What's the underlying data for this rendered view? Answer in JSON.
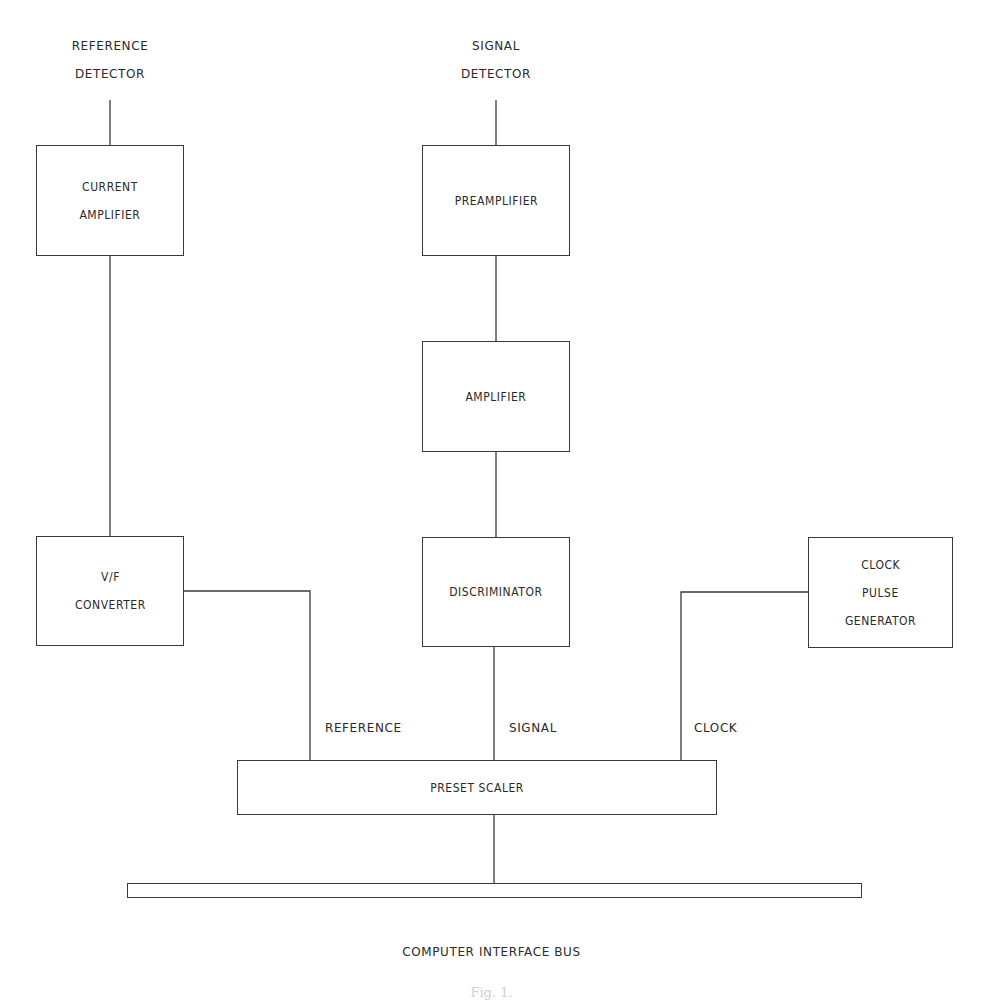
{
  "diagram": {
    "type": "block-diagram",
    "inputs": {
      "reference_detector": [
        "REFERENCE",
        "DETECTOR"
      ],
      "signal_detector": [
        "SIGNAL",
        "DETECTOR"
      ]
    },
    "blocks": {
      "current_amplifier": [
        "CURRENT",
        "AMPLIFIER"
      ],
      "vf_converter": [
        "V/F",
        "CONVERTER"
      ],
      "preamplifier": [
        "PREAMPLIFIER"
      ],
      "amplifier": [
        "AMPLIFIER"
      ],
      "discriminator": [
        "DISCRIMINATOR"
      ],
      "clock_pulse_generator": [
        "CLOCK",
        "PULSE",
        "GENERATOR"
      ],
      "preset_scaler": [
        "PRESET SCALER"
      ]
    },
    "line_labels": {
      "reference": "REFERENCE",
      "signal": "SIGNAL",
      "clock": "CLOCK"
    },
    "bus": {
      "label": "COMPUTER INTERFACE BUS"
    },
    "connections": [
      {
        "from": "REFERENCE DETECTOR",
        "to": "CURRENT AMPLIFIER"
      },
      {
        "from": "CURRENT AMPLIFIER",
        "to": "V/F CONVERTER"
      },
      {
        "from": "V/F CONVERTER",
        "to": "PRESET SCALER",
        "label": "REFERENCE"
      },
      {
        "from": "SIGNAL DETECTOR",
        "to": "PREAMPLIFIER"
      },
      {
        "from": "PREAMPLIFIER",
        "to": "AMPLIFIER"
      },
      {
        "from": "AMPLIFIER",
        "to": "DISCRIMINATOR"
      },
      {
        "from": "DISCRIMINATOR",
        "to": "PRESET SCALER",
        "label": "SIGNAL"
      },
      {
        "from": "CLOCK PULSE GENERATOR",
        "to": "PRESET SCALER",
        "label": "CLOCK"
      },
      {
        "from": "PRESET SCALER",
        "to": "COMPUTER INTERFACE BUS"
      }
    ]
  },
  "caption": {
    "text": "Fig. 1."
  }
}
